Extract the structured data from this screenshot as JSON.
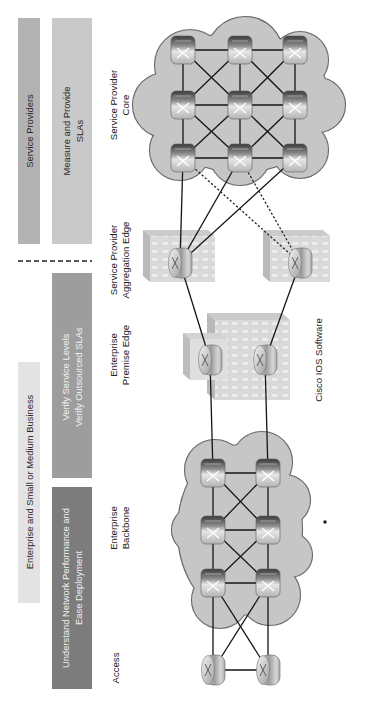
{
  "left_panel": {
    "service_providers": "Service Providers",
    "measure_sla": {
      "line1": "Measure and Provide",
      "line2": "SLAs"
    },
    "separator": "dashed-line",
    "enterprise_smb": "Enterprise and Small or Medium Business",
    "verify": {
      "line1": "Verify Service Levels",
      "line2": "Verify Outsourced SLAs"
    },
    "understand": {
      "line1": "Understand Network Performance and",
      "line2": "Ease Deployment"
    }
  },
  "tiers": {
    "sp_core": {
      "line1": "Service Provider",
      "line2": "Core"
    },
    "sp_aggregation": {
      "line1": "Service Provider",
      "line2": "Aggregation Edge"
    },
    "enterprise_premise": {
      "line1": "Enterprise",
      "line2": "Premise Edge"
    },
    "enterprise_backbone": {
      "line1": "Enterprise",
      "line2": "Backbone"
    },
    "access": "Access"
  },
  "footer_label": "Cisco IOS Software",
  "nodes": {
    "core_routers": 9,
    "aggregation_routers": 2,
    "premise_routers": 2,
    "backbone_routers": 6,
    "access_routers": 2
  },
  "icons": [
    "router-icon",
    "building-icon",
    "cloud-icon"
  ],
  "colors": {
    "service_providers_box": "#b3b3b3",
    "measure_box": "#c9c9c9",
    "enterprise_box": "#e3e3e3",
    "verify_box": "#9d9d9d",
    "understand_box": "#7c7c7c",
    "cloud_fill": "#c6c6c6",
    "cloud_stroke": "#6a6a6a",
    "link": "#151515"
  }
}
